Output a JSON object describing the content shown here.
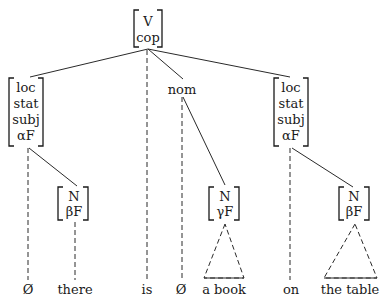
{
  "diagram": {
    "type": "syntax-tree",
    "root": {
      "lines": [
        "V",
        "cop"
      ]
    },
    "left_node": {
      "lines": [
        "loc",
        "stat",
        "subj",
        "αF"
      ]
    },
    "middle_node": {
      "label": "nom"
    },
    "right_node": {
      "lines": [
        "loc",
        "stat",
        "subj",
        "αF"
      ]
    },
    "np_there": {
      "lines": [
        "N",
        "βF"
      ]
    },
    "np_book": {
      "lines": [
        "N",
        "γF"
      ]
    },
    "np_table": {
      "lines": [
        "N",
        "βF"
      ]
    },
    "terminals": [
      "Ø",
      "there",
      "is",
      "Ø",
      "a book",
      "on",
      "the table"
    ]
  }
}
